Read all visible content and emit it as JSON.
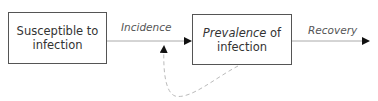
{
  "diagram": {
    "nodes": [
      {
        "id": "susceptible",
        "line1": "Susceptible to",
        "line2": "infection"
      },
      {
        "id": "prevalence",
        "line1_italic": "Prevalence",
        "line1_rest": " of",
        "line2": "infection"
      }
    ],
    "edges": [
      {
        "from": "susceptible",
        "to": "prevalence",
        "label": "Incidence",
        "style": "solid"
      },
      {
        "from": "prevalence",
        "to": "out",
        "label": "Recovery",
        "style": "solid"
      },
      {
        "from": "prevalence",
        "to": "incidence-arrow",
        "label": "",
        "style": "dashed"
      }
    ],
    "colors": {
      "box_border": "#555555",
      "arrow": "#999999",
      "arrowhead": "#111111",
      "dashed": "#bbbbbb"
    }
  }
}
